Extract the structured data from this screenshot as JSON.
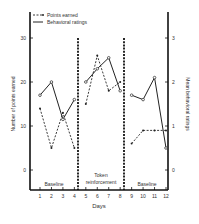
{
  "chart_data": {
    "type": "line",
    "title": "",
    "xlabel": "Days",
    "ylabel": "Number of points earned",
    "ylabel_right": "Mean behavioral ratings",
    "x": [
      1,
      2,
      3,
      4,
      5,
      6,
      7,
      8,
      9,
      10,
      11,
      12
    ],
    "xlim": [
      0,
      12.3
    ],
    "ylim": [
      0,
      33
    ],
    "ylim_right": [
      0,
      3.3
    ],
    "yticks": [
      0,
      10,
      20,
      30
    ],
    "yticks_right": [
      0,
      1,
      2,
      3
    ],
    "grid": false,
    "legend_position": "top-left",
    "phases": [
      {
        "label": "Baseline",
        "days": [
          1,
          4
        ]
      },
      {
        "label_lines": [
          "Token",
          "reinforcement"
        ],
        "days": [
          5,
          8
        ]
      },
      {
        "label": "Baseline",
        "days": [
          9,
          12
        ]
      }
    ],
    "series": [
      {
        "name": "Points earned",
        "axis": "left",
        "style": "dashed",
        "values": [
          14,
          5,
          13,
          5,
          15,
          26,
          18,
          20,
          6,
          9,
          9,
          9
        ]
      },
      {
        "name": "Behavioral ratings",
        "axis": "right",
        "style": "solid",
        "values": [
          1.7,
          2.0,
          1.15,
          1.6,
          2.0,
          2.3,
          2.55,
          1.8,
          1.7,
          1.6,
          2.1,
          0.5
        ]
      }
    ]
  }
}
